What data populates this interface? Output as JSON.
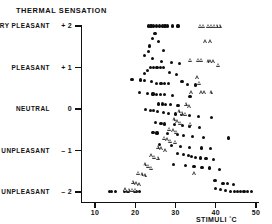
{
  "chart_title": "THERMAL  SENSATION",
  "axes": {
    "y_axis": {
      "label": "THERMAL SENSATION",
      "ticks": [
        {
          "value": 2,
          "number": "+ 2",
          "category": "VERY PLEASANT"
        },
        {
          "value": 1,
          "number": "+ 1",
          "category": "PLEASANT"
        },
        {
          "value": 0,
          "number": "0",
          "category": "NEUTRAL"
        },
        {
          "value": -1,
          "number": "– 1",
          "category": "UNPLEASANT"
        },
        {
          "value": -2,
          "number": "– 2",
          "category": "VERY UNPLEASANT"
        }
      ],
      "range": [
        -2,
        2
      ]
    },
    "x_axis": {
      "title": "STIMULI",
      "unit": "°C",
      "ticks": [
        "10",
        "20",
        "30",
        "40",
        "50"
      ],
      "tick_values": [
        10,
        20,
        30,
        40,
        50
      ],
      "range": [
        8,
        51
      ]
    }
  },
  "chart_data": {
    "type": "scatter",
    "title": "THERMAL  SENSATION",
    "xlabel": "STIMULI °C",
    "ylabel": "THERMAL SENSATION",
    "xlim": [
      8,
      51
    ],
    "ylim": [
      -2.15,
      2.15
    ],
    "grid": false,
    "legend": "none",
    "y_category_labels": {
      "2": "VERY PLEASANT",
      "1": "PLEASANT",
      "0": "NEUTRAL",
      "-1": "UNPLEASANT",
      "-2": "VERY UNPLEASANT"
    },
    "series": [
      {
        "name": "filled-circle",
        "marker": "filled-circle",
        "color": "#0d0d0d",
        "points": [
          [
            23.2,
            2.0
          ],
          [
            23.9,
            2.0
          ],
          [
            24.6,
            2.0
          ],
          [
            25.3,
            2.0
          ],
          [
            26.0,
            2.0
          ],
          [
            26.7,
            2.0
          ],
          [
            27.4,
            2.0
          ],
          [
            28.1,
            2.0
          ],
          [
            29.3,
            2.0
          ],
          [
            30.6,
            2.0
          ],
          [
            24.9,
            1.82
          ],
          [
            24.3,
            1.7
          ],
          [
            25.8,
            1.63
          ],
          [
            23.6,
            1.52
          ],
          [
            23.2,
            1.38
          ],
          [
            27.0,
            1.4
          ],
          [
            22.3,
            1.28
          ],
          [
            24.2,
            1.22
          ],
          [
            26.6,
            1.14
          ],
          [
            29.1,
            1.12
          ],
          [
            31.0,
            1.1
          ],
          [
            23.8,
            1.0
          ],
          [
            24.6,
            1.0
          ],
          [
            25.4,
            1.0
          ],
          [
            26.2,
            1.0
          ],
          [
            27.0,
            1.0
          ],
          [
            23.0,
            0.92
          ],
          [
            22.3,
            0.86
          ],
          [
            28.6,
            0.88
          ],
          [
            30.2,
            0.84
          ],
          [
            19.2,
            0.72
          ],
          [
            21.4,
            0.7
          ],
          [
            22.2,
            0.68
          ],
          [
            24.0,
            0.66
          ],
          [
            25.2,
            0.62
          ],
          [
            26.4,
            0.62
          ],
          [
            27.2,
            0.62
          ],
          [
            28.2,
            0.62
          ],
          [
            31.6,
            0.66
          ],
          [
            33.0,
            0.6
          ],
          [
            35.0,
            0.58
          ],
          [
            21.0,
            0.4
          ],
          [
            23.0,
            0.38
          ],
          [
            24.4,
            0.36
          ],
          [
            25.2,
            0.34
          ],
          [
            26.3,
            0.34
          ],
          [
            27.2,
            0.34
          ],
          [
            29.3,
            0.32
          ],
          [
            33.6,
            0.3
          ],
          [
            25.8,
            0.12
          ],
          [
            26.8,
            0.12
          ],
          [
            27.6,
            0.1
          ],
          [
            28.8,
            0.1
          ],
          [
            30.6,
            0.08
          ],
          [
            22.6,
            -0.02
          ],
          [
            23.8,
            -0.04
          ],
          [
            24.6,
            -0.04
          ],
          [
            25.5,
            -0.06
          ],
          [
            27.0,
            -0.08
          ],
          [
            28.2,
            -0.1
          ],
          [
            30.0,
            -0.12
          ],
          [
            31.4,
            -0.14
          ],
          [
            33.4,
            -0.16
          ],
          [
            35.8,
            -0.18
          ],
          [
            39.0,
            -0.2
          ],
          [
            25.0,
            -0.32
          ],
          [
            26.4,
            -0.34
          ],
          [
            27.2,
            -0.36
          ],
          [
            29.8,
            -0.38
          ],
          [
            31.8,
            -0.4
          ],
          [
            33.4,
            -0.42
          ],
          [
            36.0,
            -0.44
          ],
          [
            24.4,
            -0.56
          ],
          [
            25.4,
            -0.58
          ],
          [
            28.0,
            -0.6
          ],
          [
            30.4,
            -0.62
          ],
          [
            32.0,
            -0.64
          ],
          [
            34.2,
            -0.66
          ],
          [
            37.0,
            -0.68
          ],
          [
            43.2,
            -0.7
          ],
          [
            26.0,
            -0.86
          ],
          [
            29.0,
            -0.88
          ],
          [
            31.2,
            -0.9
          ],
          [
            33.4,
            -0.92
          ],
          [
            36.4,
            -0.94
          ],
          [
            38.6,
            -0.96
          ],
          [
            30.5,
            -1.08
          ],
          [
            32.0,
            -1.1
          ],
          [
            33.2,
            -1.12
          ],
          [
            34.0,
            -1.14
          ],
          [
            35.0,
            -1.16
          ],
          [
            36.2,
            -1.18
          ],
          [
            37.6,
            -1.2
          ],
          [
            39.4,
            -1.22
          ],
          [
            29.6,
            -1.34
          ],
          [
            32.4,
            -1.36
          ],
          [
            34.6,
            -1.38
          ],
          [
            36.6,
            -1.4
          ],
          [
            38.4,
            -1.42
          ],
          [
            41.0,
            -1.46
          ],
          [
            13.6,
            -1.98
          ],
          [
            14.2,
            -1.98
          ],
          [
            15.0,
            -1.98
          ],
          [
            17.4,
            -1.98
          ],
          [
            18.2,
            -1.98
          ],
          [
            19.8,
            -1.98
          ],
          [
            20.4,
            -1.98
          ],
          [
            21.0,
            -1.98
          ],
          [
            39.8,
            -1.72
          ],
          [
            41.8,
            -1.8
          ],
          [
            43.0,
            -1.8
          ],
          [
            44.4,
            -1.82
          ],
          [
            40.0,
            -1.92
          ],
          [
            41.2,
            -1.94
          ],
          [
            42.4,
            -1.96
          ],
          [
            43.6,
            -1.98
          ],
          [
            44.6,
            -1.98
          ],
          [
            45.4,
            -1.98
          ],
          [
            46.2,
            -1.98
          ],
          [
            47.0,
            -1.98
          ],
          [
            47.8,
            -1.98
          ],
          [
            48.8,
            -1.98
          ]
        ]
      },
      {
        "name": "open-triangle",
        "marker": "open-triangle",
        "color": "#3a3a3a",
        "points": [
          [
            36.2,
            2.0
          ],
          [
            37.0,
            2.0
          ],
          [
            38.2,
            2.0
          ],
          [
            38.9,
            2.0
          ],
          [
            39.6,
            2.0
          ],
          [
            40.3,
            2.0
          ],
          [
            41.0,
            2.0
          ],
          [
            37.4,
            1.62
          ],
          [
            38.6,
            1.62
          ],
          [
            33.6,
            1.18
          ],
          [
            35.6,
            1.18
          ],
          [
            36.4,
            1.18
          ],
          [
            38.0,
            1.14
          ],
          [
            38.7,
            1.14
          ],
          [
            39.4,
            1.14
          ],
          [
            40.6,
            1.06
          ],
          [
            35.4,
            0.76
          ],
          [
            36.0,
            0.62
          ],
          [
            34.0,
            0.4
          ],
          [
            36.4,
            0.4
          ],
          [
            37.2,
            0.4
          ],
          [
            38.8,
            0.4
          ],
          [
            32.6,
            0.12
          ],
          [
            33.4,
            0.06
          ],
          [
            30.8,
            -0.06
          ],
          [
            31.6,
            -0.1
          ],
          [
            32.4,
            -0.12
          ],
          [
            29.6,
            -0.26
          ],
          [
            30.4,
            -0.3
          ],
          [
            31.2,
            -0.34
          ],
          [
            33.6,
            -0.36
          ],
          [
            28.4,
            -0.48
          ],
          [
            29.4,
            -0.52
          ],
          [
            30.2,
            -0.56
          ],
          [
            27.2,
            -0.7
          ],
          [
            28.0,
            -0.74
          ],
          [
            28.8,
            -0.78
          ],
          [
            30.0,
            -0.8
          ],
          [
            25.6,
            -0.92
          ],
          [
            26.4,
            -0.96
          ],
          [
            27.4,
            -1.0
          ],
          [
            24.0,
            -1.12
          ],
          [
            24.8,
            -1.16
          ],
          [
            25.6,
            -1.18
          ],
          [
            22.4,
            -1.34
          ],
          [
            23.2,
            -1.38
          ],
          [
            24.0,
            -1.42
          ],
          [
            20.8,
            -1.54
          ],
          [
            21.6,
            -1.58
          ],
          [
            22.4,
            -1.6
          ],
          [
            34.6,
            -1.56
          ],
          [
            19.4,
            -1.76
          ],
          [
            20.2,
            -1.8
          ],
          [
            21.0,
            -1.82
          ],
          [
            17.6,
            -1.94
          ],
          [
            18.4,
            -1.96
          ],
          [
            19.2,
            -1.96
          ],
          [
            20.0,
            -1.96
          ]
        ]
      }
    ]
  }
}
